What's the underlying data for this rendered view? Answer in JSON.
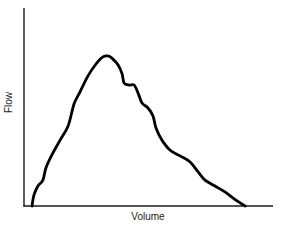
{
  "chart_data": {
    "type": "line",
    "title": "",
    "xlabel": "Volume",
    "ylabel": "Flow",
    "grid": false,
    "legend": null,
    "x_ticks": [],
    "y_ticks": [],
    "xlim": [
      0,
      100
    ],
    "ylim": [
      0,
      100
    ],
    "series": [
      {
        "name": "Flow-Volume curve",
        "color": "#000000",
        "x": [
          3.2,
          4.0,
          5.6,
          7.6,
          8.8,
          11.2,
          14.5,
          17.7,
          20.1,
          22.5,
          25.7,
          28.9,
          31.7,
          33.7,
          35.3,
          37.8,
          39.4,
          40.2,
          42.2,
          44.2,
          45.8,
          47.4,
          49.8,
          51.8,
          53.0,
          55.4,
          58.6,
          62.7,
          66.7,
          69.9,
          72.7,
          76.7,
          80.7,
          85.1,
          88.8
        ],
        "y": [
          0,
          5.6,
          10.1,
          13.1,
          19.2,
          25.8,
          33.3,
          40.4,
          51.5,
          57.6,
          65.7,
          71.7,
          75.3,
          75.8,
          74.7,
          71.2,
          66.7,
          62.1,
          61.1,
          61.1,
          57.1,
          52.0,
          49.5,
          45.5,
          39.4,
          33.3,
          28.3,
          25.3,
          22.2,
          17.2,
          13.1,
          10.1,
          7.1,
          3.0,
          0
        ]
      }
    ]
  },
  "plot": {
    "axis_color": "#000000",
    "line_color": "#000000",
    "origin_px": [
      24,
      206
    ],
    "x_end_px": 273,
    "y_top_px": 8
  }
}
